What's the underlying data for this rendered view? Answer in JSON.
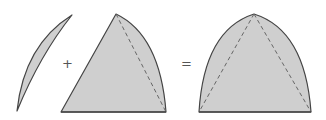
{
  "diagram": {
    "operators": {
      "plus": "+",
      "equals": "="
    },
    "colors": {
      "fill": "#cfcfcf",
      "stroke": "#444444",
      "dashed": "#666666",
      "operator": "#555555"
    },
    "shapes": [
      {
        "id": "lens",
        "label": "circular segment (lens)"
      },
      {
        "id": "curved-triangle",
        "label": "triangle with one curved side, dashed chord"
      },
      {
        "id": "result",
        "label": "symmetric curved triangle with two dashed chords"
      }
    ]
  }
}
